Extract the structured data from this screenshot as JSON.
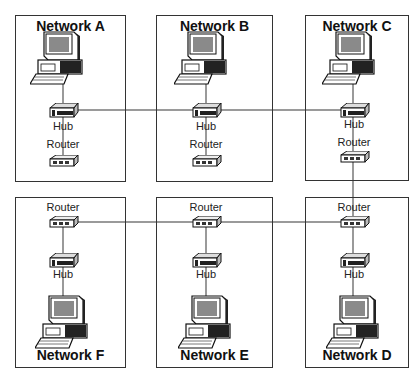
{
  "networks": {
    "a": {
      "title": "Network A",
      "hub": "Hub",
      "router": "Router"
    },
    "b": {
      "title": "Network B",
      "hub": "Hub",
      "router": "Router"
    },
    "c": {
      "title": "Network C",
      "hub": "Hub",
      "router": "Router"
    },
    "d": {
      "title": "Network D",
      "hub": "Hub",
      "router": "Router"
    },
    "e": {
      "title": "Network E",
      "hub": "Hub",
      "router": "Router"
    },
    "f": {
      "title": "Network F",
      "hub": "Hub",
      "router": "Router"
    }
  },
  "colors": {
    "border": "#333333",
    "link": "#9a9a9a",
    "screen": "#8a8a8a"
  }
}
